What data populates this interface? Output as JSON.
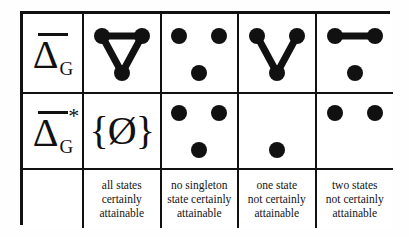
{
  "figure": {
    "rows": [
      {
        "id": "row-delta-g",
        "label": {
          "symbol": "Δ",
          "subscript": "G",
          "overline": true,
          "star": ""
        }
      },
      {
        "id": "row-delta-g-star",
        "label": {
          "symbol": "Δ",
          "subscript": "G",
          "overline": true,
          "star": "*"
        }
      }
    ],
    "columns": [
      {
        "id": "col-1",
        "caption": "all states certainly attainable",
        "caption_lines": [
          "all states",
          "certainly",
          "attainable"
        ],
        "top_cell": {
          "kind": "graph",
          "name": "triangle-graph"
        },
        "bottom_cell": {
          "kind": "symbol",
          "name": "empty-set-singleton",
          "text": "{Ø}"
        }
      },
      {
        "id": "col-2",
        "caption": "no singleton state certainly attainable",
        "caption_lines": [
          "no singleton",
          "state certainly",
          "attainable"
        ],
        "top_cell": {
          "kind": "graph",
          "name": "three-isolated-vertices-graph"
        },
        "bottom_cell": {
          "kind": "graph",
          "name": "three-isolated-vertices-graph"
        }
      },
      {
        "id": "col-3",
        "caption": "one state not certainly attainable",
        "caption_lines": [
          "one state",
          "not certainly",
          "attainable"
        ],
        "top_cell": {
          "kind": "graph",
          "name": "path-v-graph"
        },
        "bottom_cell": {
          "kind": "graph",
          "name": "single-vertex-graph"
        }
      },
      {
        "id": "col-4",
        "caption": "two states not certainly attainable",
        "caption_lines": [
          "two states",
          "not certainly",
          "attainable"
        ],
        "top_cell": {
          "kind": "graph",
          "name": "single-edge-plus-isolated-graph"
        },
        "bottom_cell": {
          "kind": "graph",
          "name": "two-isolated-vertices-graph"
        }
      }
    ],
    "blank_corner_label": "",
    "colors": {
      "ink": "#111111",
      "background": "#ffffff"
    }
  }
}
